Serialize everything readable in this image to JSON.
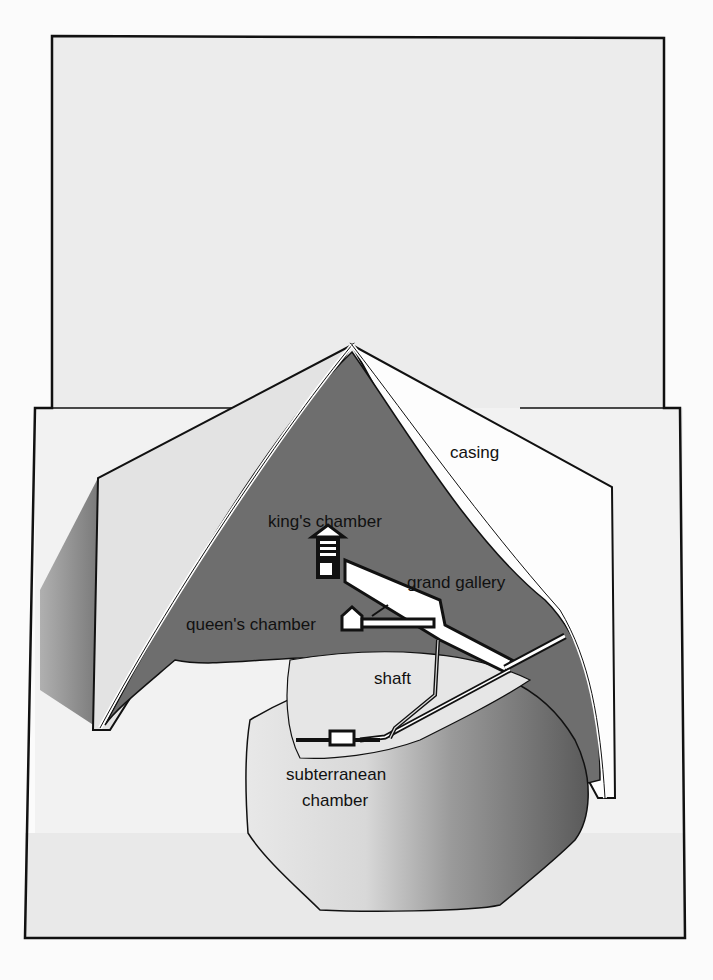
{
  "diagram": {
    "labels": {
      "casing": "casing",
      "kings_chamber": "king's chamber",
      "grand_gallery": "grand gallery",
      "queens_chamber": "queen's chamber",
      "shaft": "shaft",
      "subterranean_line1": "subterranean",
      "subterranean_line2": "chamber"
    },
    "colors": {
      "sky": "#eeeeee",
      "ground": "#f0f0f0",
      "interior": "#6e6e6e",
      "casing_face": "#fafafa",
      "left_face": "#e6e6e6",
      "shadow": "#8a8a8a",
      "outline": "#111111",
      "passage": "#ffffff"
    }
  }
}
